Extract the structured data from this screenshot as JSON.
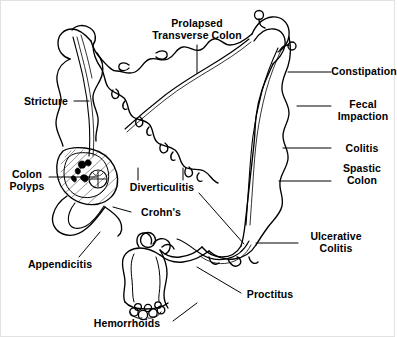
{
  "figure": {
    "background_color": "#ffffff",
    "line_color": "#000000",
    "border_color": "#e2e2e2",
    "text_color": "#000000"
  },
  "labels": [
    {
      "id": "prolapsed-transverse-colon",
      "text": "Prolapsed\nTransverse Colon",
      "x": 196,
      "y": 22,
      "align": "center"
    },
    {
      "id": "stricture",
      "text": "Stricture",
      "x": 45,
      "y": 100,
      "align": "center"
    },
    {
      "id": "constipation",
      "text": "Constipation",
      "x": 363,
      "y": 70,
      "align": "center"
    },
    {
      "id": "fecal-impaction",
      "text": "Fecal\nImpaction",
      "x": 362,
      "y": 103,
      "align": "center"
    },
    {
      "id": "colitis",
      "text": "Colitis",
      "x": 361,
      "y": 147,
      "align": "center"
    },
    {
      "id": "spastic-colon",
      "text": "Spastic\nColon",
      "x": 361,
      "y": 167,
      "align": "center"
    },
    {
      "id": "colon-polyps",
      "text": "Colon\nPolyps",
      "x": 26,
      "y": 173,
      "align": "center"
    },
    {
      "id": "diverticulitis",
      "text": "Diverticulitis",
      "x": 161,
      "y": 186,
      "align": "center"
    },
    {
      "id": "crohns",
      "text": "Crohn's",
      "x": 160,
      "y": 211,
      "align": "center"
    },
    {
      "id": "ulcerative-colitis",
      "text": "Ulcerative\nColitis",
      "x": 335,
      "y": 235,
      "align": "center"
    },
    {
      "id": "appendicitis",
      "text": "Appendicitis",
      "x": 59,
      "y": 263,
      "align": "center"
    },
    {
      "id": "proctitus",
      "text": "Proctitus",
      "x": 269,
      "y": 293,
      "align": "center"
    },
    {
      "id": "hemorrhoids",
      "text": "Hemorrhoids",
      "x": 126,
      "y": 322,
      "align": "center"
    }
  ],
  "leaders": [
    {
      "id": "leader-prolapsed-transverse-colon",
      "points": "196,44 196,72"
    },
    {
      "id": "leader-stricture",
      "points": "73,100 88,100"
    },
    {
      "id": "leader-constipation",
      "points": "287,71 330,71"
    },
    {
      "id": "leader-fecal-impaction",
      "points": "296,105 330,105"
    },
    {
      "id": "leader-colitis",
      "points": "282,147 330,147"
    },
    {
      "id": "leader-spastic-colon",
      "points": "278,180 330,180"
    },
    {
      "id": "leader-colon-polyps",
      "points": "48,176 96,176"
    },
    {
      "id": "leader-diverticulitis-a",
      "points": "137,167 137,179"
    },
    {
      "id": "leader-diverticulitis-b",
      "points": "182,167 182,179"
    },
    {
      "id": "leader-diverticulitis-c",
      "points": "198,192 243,243"
    },
    {
      "id": "leader-crohns",
      "points": "130,211 112,206"
    },
    {
      "id": "leader-ulcerative-colitis",
      "points": "255,242 297,242"
    },
    {
      "id": "leader-appendicitis",
      "points": "78,256 99,231"
    },
    {
      "id": "leader-proctitus",
      "points": "240,292 196,266"
    },
    {
      "id": "leader-hemorrhoids",
      "points": "172,320 196,302"
    }
  ]
}
